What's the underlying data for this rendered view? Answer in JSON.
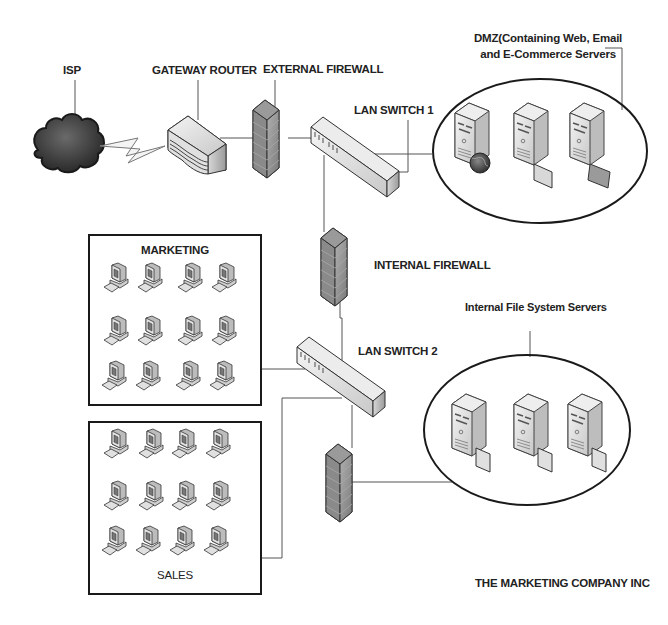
{
  "diagram": {
    "title": "THE MARKETING COMPANY INC",
    "nodes": {
      "isp": {
        "label": "ISP",
        "icon": "cloud-icon"
      },
      "gateway_router": {
        "label": "GATEWAY ROUTER",
        "icon": "router-icon"
      },
      "external_firewall": {
        "label": "EXTERNAL FIREWALL",
        "icon": "firewall-icon"
      },
      "lan_switch_1": {
        "label": "LAN SWITCH 1",
        "icon": "switch-icon"
      },
      "dmz": {
        "label_line1": "DMZ(Containing Web, Email",
        "label_line2": "and E-Commerce Servers",
        "servers": [
          {
            "name": "web-server",
            "icon": "server-globe-icon"
          },
          {
            "name": "email-server",
            "icon": "server-mail-icon"
          },
          {
            "name": "ecommerce-server",
            "icon": "server-mail-icon"
          }
        ]
      },
      "internal_firewall": {
        "label": "INTERNAL FIREWALL",
        "icon": "firewall-icon"
      },
      "lan_switch_2": {
        "label": "LAN SWITCH 2",
        "icon": "switch-icon"
      },
      "file_servers": {
        "label": "Internal File System Servers",
        "servers": [
          {
            "name": "file-server-1",
            "icon": "server-file-icon"
          },
          {
            "name": "file-server-2",
            "icon": "server-file-icon"
          },
          {
            "name": "file-server-3",
            "icon": "server-file-icon"
          }
        ]
      },
      "third_firewall": {
        "icon": "firewall-icon"
      },
      "marketing": {
        "label": "MARKETING",
        "workstations": 12,
        "rows": 3,
        "cols": 4
      },
      "sales": {
        "label": "SALES",
        "workstations": 12,
        "rows": 3,
        "cols": 4
      }
    },
    "connections": [
      [
        "isp",
        "gateway_router",
        "wan-link"
      ],
      [
        "gateway_router",
        "external_firewall"
      ],
      [
        "external_firewall",
        "lan_switch_1"
      ],
      [
        "lan_switch_1",
        "dmz"
      ],
      [
        "lan_switch_1",
        "internal_firewall"
      ],
      [
        "internal_firewall",
        "lan_switch_2"
      ],
      [
        "lan_switch_2",
        "marketing"
      ],
      [
        "lan_switch_2",
        "sales"
      ],
      [
        "lan_switch_2",
        "third_firewall"
      ],
      [
        "third_firewall",
        "file_servers"
      ]
    ]
  }
}
